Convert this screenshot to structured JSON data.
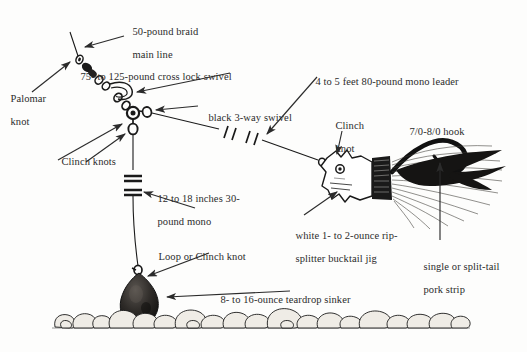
{
  "diagram": {
    "type": "fishing-tackle-illustration",
    "colors": {
      "ink": "#1a1a1a",
      "paper": "#fdfdfc",
      "text": "#2b2b2b",
      "rock_fill": "#efece6"
    }
  },
  "labels": {
    "main_line": {
      "line1": "50-pound braid",
      "line2": "main line"
    },
    "palomar_knot": {
      "line1": "Palomar",
      "line2": "knot"
    },
    "cross_lock_swivel": {
      "line1": "75- to 125-pound cross lock swivel"
    },
    "three_way_swivel": {
      "line1": "black 3-way swivel"
    },
    "clinch_knots": {
      "line1": "Clinch knots"
    },
    "dropper_mono": {
      "line1": "12 to 18 inches 30-",
      "line2": "pound mono"
    },
    "loop_or_clinch": {
      "line1": "Loop or Clinch knot"
    },
    "sinker": {
      "line1": "8- to 16-ounce teardrop sinker"
    },
    "mono_leader": {
      "line1": "4 to 5 feet 80-pound mono leader"
    },
    "clinch_knot": {
      "line1": "Clinch",
      "line2": "knot"
    },
    "hook": {
      "line1": "7/0-8/0 hook"
    },
    "bucktail_jig": {
      "line1": "white 1- to 2-ounce rip-",
      "line2": "splitter bucktail jig"
    },
    "pork_strip": {
      "line1": "single or split-tail",
      "line2": "pork strip"
    }
  },
  "parts": [
    {
      "name": "main-line",
      "description": "50-pound braid main line"
    },
    {
      "name": "palomar-knot",
      "description": "Palomar knot"
    },
    {
      "name": "cross-lock-swivel",
      "description": "75- to 125-pound cross lock swivel"
    },
    {
      "name": "three-way-swivel",
      "description": "black 3-way swivel"
    },
    {
      "name": "clinch-knots",
      "description": "Clinch knots"
    },
    {
      "name": "dropper-line",
      "description": "12 to 18 inches 30-pound mono"
    },
    {
      "name": "loop-or-clinch-knot",
      "description": "Loop or Clinch knot"
    },
    {
      "name": "teardrop-sinker",
      "description": "8- to 16-ounce teardrop sinker"
    },
    {
      "name": "mono-leader",
      "description": "4 to 5 feet 80-pound mono leader"
    },
    {
      "name": "bucktail-jig",
      "description": "white 1- to 2-ounce rip-splitter bucktail jig"
    },
    {
      "name": "hook",
      "description": "7/0-8/0 hook"
    },
    {
      "name": "pork-strip",
      "description": "single or split-tail pork strip"
    },
    {
      "name": "bottom-rocks",
      "description": "rocky bottom"
    }
  ]
}
